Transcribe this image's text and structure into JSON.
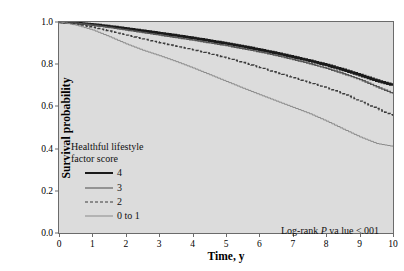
{
  "chart_data": {
    "type": "line",
    "title": "",
    "xlabel": "Time, y",
    "ylabel": "Survival probability",
    "xlim": [
      0,
      10
    ],
    "ylim": [
      0.0,
      1.0
    ],
    "grid": false,
    "legend_position": "inside-lower-left",
    "legend_title_line1": "Healthful lifestyle",
    "legend_title_line2": "factor score",
    "annotation": "Log-rank P va lue <.001",
    "annotation_prefix": "Log-rank ",
    "annotation_italic": "P",
    "annotation_suffix": " va lue <.001",
    "xticks": [
      "0",
      "1",
      "2",
      "3",
      "4",
      "5",
      "6",
      "7",
      "8",
      "9",
      "10"
    ],
    "xtick_values": [
      0,
      1,
      2,
      3,
      4,
      5,
      6,
      7,
      8,
      9,
      10
    ],
    "yticks": [
      "0.0",
      "0.2",
      "0.4",
      "0.6",
      "0.8",
      "1.0"
    ],
    "ytick_values": [
      0.0,
      0.2,
      0.4,
      0.6,
      0.8,
      1.0
    ],
    "x": [
      0,
      0.5,
      1,
      1.5,
      2,
      2.5,
      3,
      3.5,
      4,
      4.5,
      5,
      5.5,
      6,
      6.5,
      7,
      7.5,
      8,
      8.5,
      9,
      9.5,
      10
    ],
    "series": [
      {
        "name": "4",
        "label": "4",
        "style": "solid",
        "width": 2.6,
        "color": "#1a1a1a",
        "values": [
          1.0,
          0.995,
          0.988,
          0.979,
          0.969,
          0.958,
          0.947,
          0.936,
          0.924,
          0.911,
          0.898,
          0.884,
          0.868,
          0.852,
          0.834,
          0.816,
          0.796,
          0.773,
          0.748,
          0.722,
          0.7
        ]
      },
      {
        "name": "3",
        "label": "3",
        "style": "solid",
        "width": 1.4,
        "color": "#555555",
        "values": [
          1.0,
          0.994,
          0.985,
          0.974,
          0.962,
          0.95,
          0.938,
          0.926,
          0.914,
          0.901,
          0.888,
          0.873,
          0.858,
          0.841,
          0.822,
          0.802,
          0.78,
          0.755,
          0.727,
          0.693,
          0.66
        ]
      },
      {
        "name": "2",
        "label": "2",
        "style": "dashed",
        "width": 1.4,
        "color": "#3a3a3a",
        "values": [
          1.0,
          0.99,
          0.975,
          0.957,
          0.938,
          0.92,
          0.902,
          0.885,
          0.868,
          0.85,
          0.83,
          0.808,
          0.784,
          0.76,
          0.736,
          0.712,
          0.688,
          0.66,
          0.625,
          0.59,
          0.555
        ]
      },
      {
        "name": "0 to 1",
        "label": "0 to 1",
        "style": "solid",
        "width": 1.0,
        "color": "#8a8a8a",
        "values": [
          1.0,
          0.985,
          0.962,
          0.93,
          0.896,
          0.866,
          0.84,
          0.812,
          0.782,
          0.75,
          0.718,
          0.686,
          0.655,
          0.625,
          0.595,
          0.565,
          0.53,
          0.492,
          0.455,
          0.424,
          0.41
        ]
      }
    ]
  }
}
